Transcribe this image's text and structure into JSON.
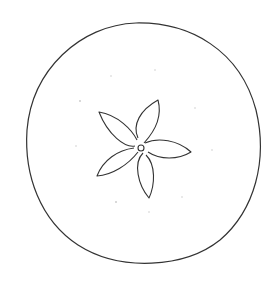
{
  "image": {
    "subject": "apple cross-section line drawing",
    "background": "#ffffff",
    "stroke_color": "#333333",
    "outline": {
      "cx": 144,
      "cy": 145,
      "rx": 118,
      "ry": 122
    },
    "core_center": {
      "x": 141,
      "y": 147
    },
    "petal_count": 5,
    "seed_dots": 9
  }
}
